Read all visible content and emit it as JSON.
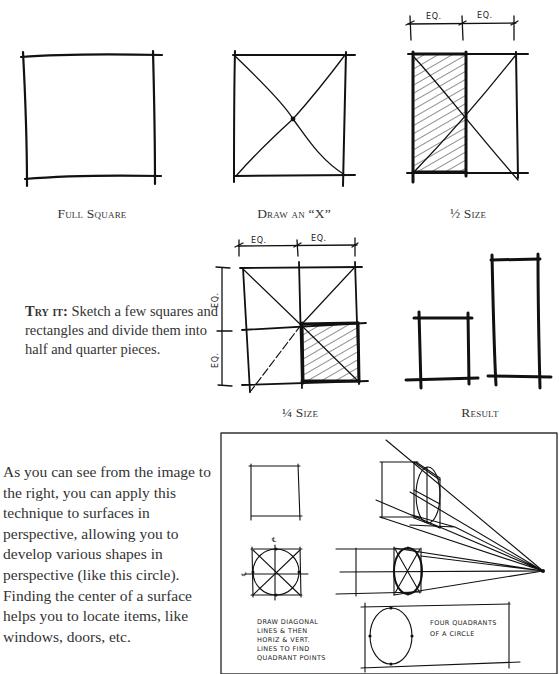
{
  "figures": {
    "full_square": {
      "caption": "Full Square"
    },
    "draw_x": {
      "caption": "Draw an “X”"
    },
    "half_size": {
      "caption": "½ Size",
      "dim_labels": [
        "EQ.",
        "EQ."
      ]
    },
    "quarter_size": {
      "caption": "¼ Size",
      "dim_labels_top": [
        "EQ.",
        "EQ."
      ],
      "dim_labels_side": [
        "EQ.",
        "EQ."
      ]
    },
    "result": {
      "caption": "Result"
    }
  },
  "try_it": {
    "label": "Try it:",
    "text": " Sketch a few squares and rectangles and divide them into half and quarter pieces."
  },
  "paragraph": {
    "text": "As you can see from the image to the right, you can apply this technique to surfaces in perspective, allowing you to develop various shapes in perspective (like this circle). Finding the center of a surface helps you to locate items, like windows, doors, etc."
  },
  "perspective_figure": {
    "centerline_mark": "℄",
    "note_left": [
      "DRAW DIAGONAL",
      "LINES & THEN",
      "HORIZ & VERT.",
      "LINES TO FIND",
      "QUADRANT POINTS"
    ],
    "note_right": [
      "FOUR QUADRANTS",
      "OF A CIRCLE"
    ]
  }
}
